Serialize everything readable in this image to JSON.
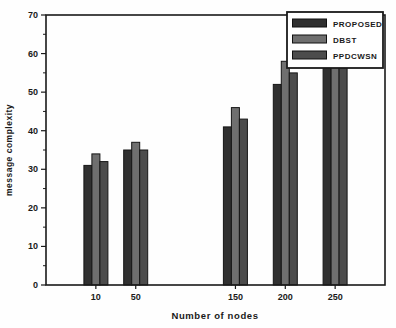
{
  "chart_data": {
    "type": "bar",
    "title": "",
    "xlabel": "Number of nodes",
    "ylabel": "message complexity",
    "categories": [
      10,
      50,
      150,
      200,
      250
    ],
    "series": [
      {
        "name": "PROPOSED",
        "color": "#303030",
        "values": [
          31,
          35,
          41,
          52,
          62
        ]
      },
      {
        "name": "DBST",
        "color": "#6f6f6f",
        "values": [
          34,
          37,
          46,
          58,
          64
        ]
      },
      {
        "name": "PPDCWSN",
        "color": "#4c4c4c",
        "values": [
          32,
          35,
          43,
          55,
          63
        ]
      }
    ],
    "ylim": [
      0,
      70
    ],
    "xlim": [
      -40,
      300
    ],
    "y_ticks": [
      0,
      10,
      20,
      30,
      40,
      50,
      60,
      70
    ],
    "y_minor_step": 5,
    "grid": false,
    "legend_position": "top-right",
    "bar_outline_color": "#161616",
    "axis_color": "#1a1a1a",
    "note": "Tops of the bars at x=250 are hidden behind the opaque legend box; those values are estimated."
  }
}
